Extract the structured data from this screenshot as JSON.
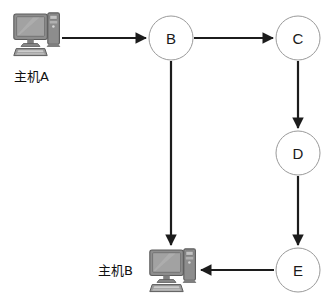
{
  "diagram": {
    "background_color": "#ffffff",
    "edge_color": "#1c1c1c",
    "node_stroke_color": "#9a9a9a",
    "node_fill_color": "#ffffff",
    "hosts": [
      {
        "id": "host-a",
        "label": "主机A",
        "icon": "desktop-computer-icon",
        "label_position": "below"
      },
      {
        "id": "host-b",
        "label": "主机B",
        "icon": "desktop-computer-icon",
        "label_position": "left"
      }
    ],
    "nodes": [
      {
        "id": "node-b",
        "label": "B",
        "cx": 171,
        "cy": 38,
        "r": 22
      },
      {
        "id": "node-c",
        "label": "C",
        "cx": 298,
        "cy": 38,
        "r": 22
      },
      {
        "id": "node-d",
        "label": "D",
        "cx": 298,
        "cy": 153,
        "r": 22
      },
      {
        "id": "node-e",
        "label": "E",
        "cx": 298,
        "cy": 270,
        "r": 22
      }
    ],
    "edges": [
      {
        "id": "edge-hosta-b",
        "from": "主机A",
        "to": "B",
        "direction": "right"
      },
      {
        "id": "edge-b-c",
        "from": "B",
        "to": "C",
        "direction": "right"
      },
      {
        "id": "edge-c-d",
        "from": "C",
        "to": "D",
        "direction": "down"
      },
      {
        "id": "edge-d-e",
        "from": "D",
        "to": "E",
        "direction": "down"
      },
      {
        "id": "edge-e-hostb",
        "from": "E",
        "to": "主机B",
        "direction": "left"
      },
      {
        "id": "edge-b-hostb",
        "from": "B",
        "to": "主机B",
        "direction": "down"
      }
    ]
  }
}
